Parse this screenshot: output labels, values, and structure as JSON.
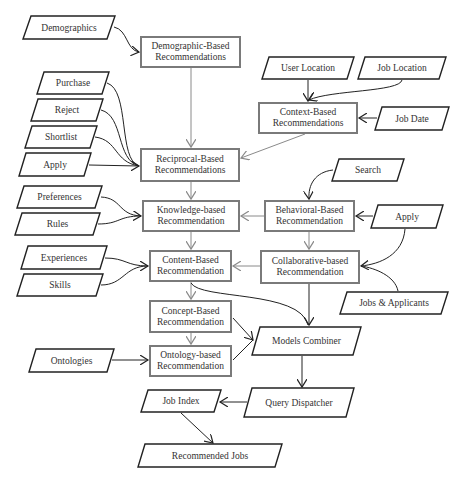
{
  "diagram": {
    "recommenders": {
      "demographic": {
        "line1": "Demographic-Based",
        "line2": "Recommendations"
      },
      "context": {
        "line1": "Context-Based",
        "line2": "Recommendations"
      },
      "reciprocal": {
        "line1": "Reciprocal-Based",
        "line2": "Recommendations"
      },
      "knowledge": {
        "line1": "Knowledge-based",
        "line2": "Recommendation"
      },
      "behavioral": {
        "line1": "Behavioral-Based",
        "line2": "Recommendation"
      },
      "content": {
        "line1": "Content-Based",
        "line2": "Recommendation"
      },
      "collaborative": {
        "line1": "Collaborative-based",
        "line2": "Recommendation"
      },
      "concept": {
        "line1": "Concept-Based",
        "line2": "Recommendation"
      },
      "ontology": {
        "line1": "Ontology-based",
        "line2": "Recommendation"
      }
    },
    "inputs": {
      "demographics": "Demographics",
      "purchase": "Purchase",
      "reject": "Reject",
      "shortlist": "Shortlist",
      "apply_left": "Apply",
      "preferences": "Preferences",
      "rules": "Rules",
      "experiences": "Experiences",
      "skills": "Skills",
      "ontologies": "Ontologies",
      "user_location": "User Location",
      "job_location": "Job Location",
      "job_date": "Job Date",
      "search": "Search",
      "apply_right": "Apply",
      "jobs_applicants": "Jobs & Applicants"
    },
    "processing": {
      "models_combiner": "Models Combiner",
      "query_dispatcher": "Query Dispatcher",
      "job_index": "Job Index",
      "recommended_jobs": "Recommended Jobs"
    },
    "colors": {
      "box_border": "#7a7a7a",
      "input_border": "#222222",
      "arrow_gray": "#8a8a8a",
      "arrow_black": "#222222"
    }
  }
}
